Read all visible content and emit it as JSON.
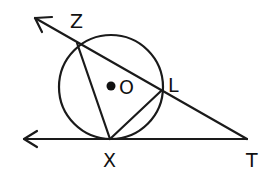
{
  "diagram": {
    "type": "geometry",
    "stroke_color": "#1a1a1a",
    "background": "#ffffff",
    "circle": {
      "center_label": "O",
      "cx": 111,
      "cy": 87,
      "r": 52
    },
    "points": {
      "Z": {
        "label": "Z",
        "x": 77,
        "y": 43
      },
      "L": {
        "label": "L",
        "x": 161,
        "y": 91
      },
      "X": {
        "label": "X",
        "x": 110,
        "y": 139
      },
      "T": {
        "label": "T",
        "x": 247,
        "y": 139
      },
      "O": {
        "label": "O",
        "x": 111,
        "y": 86
      }
    },
    "segments": [
      {
        "name": "ray-TZ",
        "from": "T",
        "through": "Z",
        "arrow": "beyond Z"
      },
      {
        "name": "ray-TX",
        "from": "T",
        "through": "X",
        "arrow": "beyond X"
      },
      {
        "name": "chord-ZX",
        "from": "Z",
        "to": "X"
      },
      {
        "name": "chord-XL",
        "from": "X",
        "to": "L"
      }
    ]
  }
}
